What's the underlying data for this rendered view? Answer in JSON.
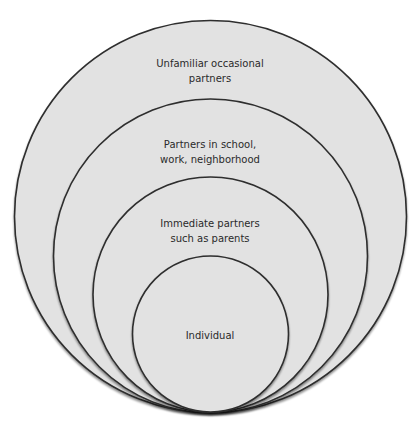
{
  "diagram": {
    "type": "nested-circles",
    "fill_color": "#e2e2e2",
    "stroke_color": "#2e2e2e",
    "background_color": "#ffffff",
    "layers": [
      {
        "id": "outer",
        "label": "Unfamiliar occasional\npartners",
        "cx": 210.5,
        "cy": 216.5,
        "r": 196
      },
      {
        "id": "second",
        "label": "Partners in school,\nwork, neighborhood",
        "cx": 210.5,
        "cy": 256,
        "r": 157
      },
      {
        "id": "third",
        "label": "Immediate partners\nsuch as parents",
        "cx": 210.5,
        "cy": 294.5,
        "r": 117.5
      },
      {
        "id": "inner",
        "label": "Individual",
        "cx": 210.5,
        "cy": 334,
        "r": 78
      }
    ]
  }
}
